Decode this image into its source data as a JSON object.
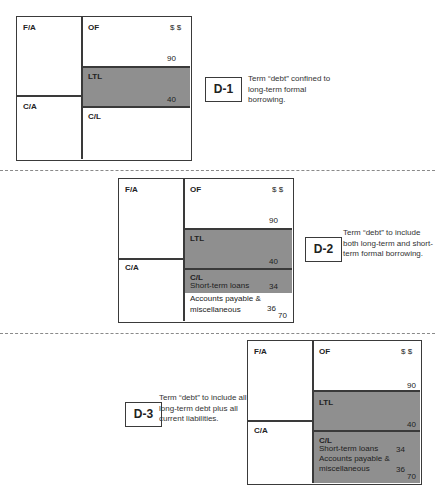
{
  "diagrams": [
    {
      "id": "D-1",
      "description": "Term “debt” confined to long-term formal borrowing.",
      "left_column": {
        "top": "F/A",
        "bottom": "C/A"
      },
      "right_column": {
        "of": {
          "label": "OF",
          "currency": "$ $",
          "value": "90"
        },
        "ltl": {
          "label": "LTL",
          "value": "40",
          "shaded": true
        },
        "cl": {
          "label": "C/L",
          "shaded": false
        }
      }
    },
    {
      "id": "D-2",
      "description": "Term “debt” to include both long-term and short-term formal borrowing.",
      "left_column": {
        "top": "F/A",
        "bottom": "C/A"
      },
      "right_column": {
        "of": {
          "label": "OF",
          "currency": "$ $",
          "value": "90"
        },
        "ltl": {
          "label": "LTL",
          "value": "40",
          "shaded": true
        },
        "cl": {
          "label": "C/L",
          "items": [
            {
              "name": "Short-term loans",
              "value": "34",
              "shaded": true
            },
            {
              "name_line1": "Accounts payable &",
              "name_line2": "miscellaneous",
              "value": "36",
              "shaded": false
            }
          ],
          "total": "70"
        }
      }
    },
    {
      "id": "D-3",
      "description": "Term “debt” to include all long-term debt plus all current liabilities.",
      "left_column": {
        "top": "F/A",
        "bottom": "C/A"
      },
      "right_column": {
        "of": {
          "label": "OF",
          "currency": "$ $",
          "value": "90"
        },
        "ltl": {
          "label": "LTL",
          "value": "40",
          "shaded": true
        },
        "cl": {
          "label": "C/L",
          "items": [
            {
              "name": "Short-term loans",
              "value": "34",
              "shaded": true
            },
            {
              "name_line1": "Accounts payable &",
              "name_line2": "miscellaneous",
              "value": "36",
              "shaded": true
            }
          ],
          "total": "70"
        }
      }
    }
  ],
  "colors": {
    "shade": "#8f8f8f",
    "line": "#3a3a3a",
    "dash": "#8a8a8a"
  }
}
